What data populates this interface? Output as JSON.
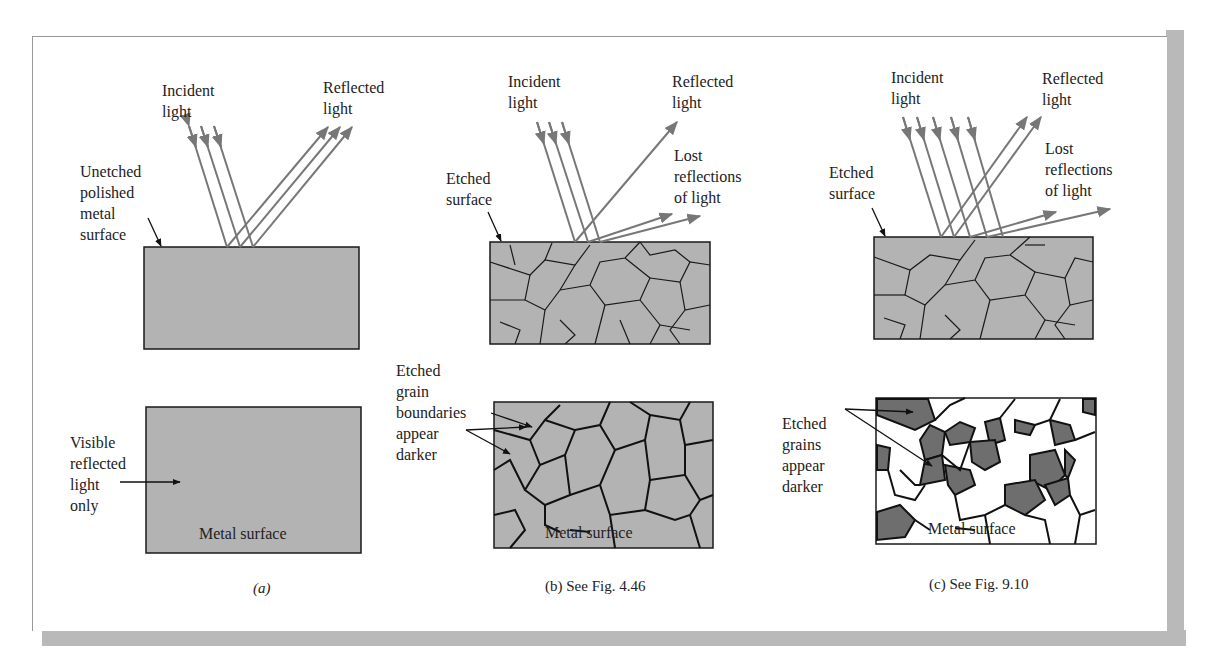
{
  "figure": {
    "panels": [
      {
        "id": "a",
        "incident_label": "Incident\nlight",
        "reflected_label": "Reflected\nlight",
        "surface_label": "Unetched\npolished\nmetal\nsurface",
        "view_label": "Visible\nreflected\nlight\nonly",
        "metal_label": "Metal surface",
        "caption": "(a)"
      },
      {
        "id": "b",
        "incident_label": "Incident\nlight",
        "reflected_label": "Reflected\nlight",
        "lost_label": "Lost\nreflections\nof light",
        "surface_label": "Etched\nsurface",
        "view_label": "Etched\ngrain\nboundaries\nappear\ndarker",
        "metal_label": "Metal surface",
        "caption": "(b) See Fig. 4.46"
      },
      {
        "id": "c",
        "incident_label": "Incident\nlight",
        "reflected_label": "Reflected\nlight",
        "lost_label": "Lost\nreflections\nof light",
        "surface_label": "Etched\nsurface",
        "view_label": "Etched\ngrains\nappear\ndarker",
        "metal_label": "Metal surface",
        "caption": "(c) See Fig. 9.10"
      }
    ],
    "colors": {
      "metal_fill": "#b3b3b3",
      "dark_grain": "#6e6e6e",
      "ray": "#777777",
      "outline": "#1a1a1a",
      "shadow": "#b9b9b9"
    }
  }
}
